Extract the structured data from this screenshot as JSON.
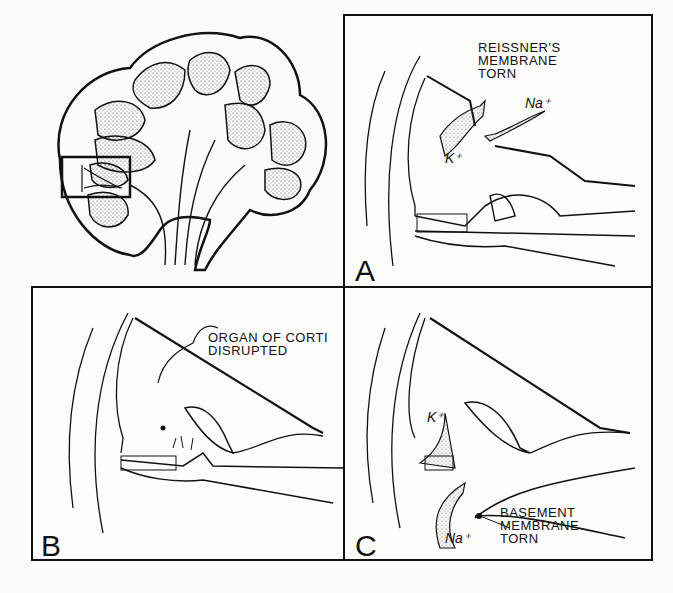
{
  "figure": {
    "overview": {
      "description": "cochlea cross-section overview with inset box"
    },
    "panels": [
      {
        "id": "A",
        "letter": "A",
        "annotation": [
          "REISSNER'S",
          "MEMBRANE",
          "TORN"
        ],
        "ions": {
          "na": "Na⁺",
          "k": "K⁺"
        }
      },
      {
        "id": "B",
        "letter": "B",
        "annotation": [
          "ORGAN OF CORTI",
          "DISRUPTED"
        ]
      },
      {
        "id": "C",
        "letter": "C",
        "annotation": [
          "BASEMENT",
          "MEMBRANE",
          "TORN"
        ],
        "ions": {
          "na": "Na⁺",
          "k": "K⁺"
        }
      }
    ],
    "colors": {
      "ink": "#111111",
      "paper": "#fbfbfa",
      "stipple": "#555555"
    }
  }
}
